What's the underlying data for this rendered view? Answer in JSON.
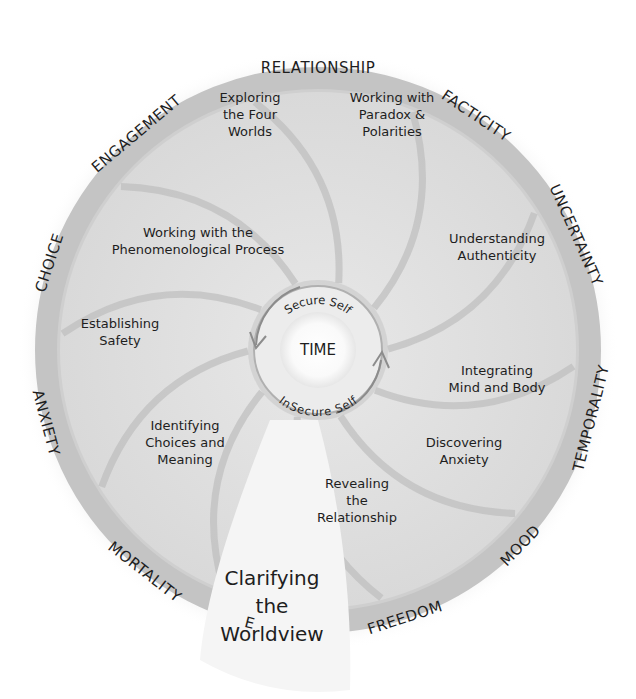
{
  "colors": {
    "background": "#ffffff",
    "ring": "#c9c9c9",
    "disk": "#dedede",
    "wedge_line": "#bdbdbd",
    "highlight_wedge": "#f4f4f4",
    "hub": "#fafafa",
    "hub_ring": "#a9a9a9",
    "text": "#1e1e1e"
  },
  "hub": {
    "center_label": "TIME",
    "top_label": "Secure Self",
    "bottom_label": "InSecure Self"
  },
  "outer_ring_labels": [
    "RELATIONSHIP",
    "FACTICITY",
    "UNCERTAINTY",
    "TEMPORALITY",
    "MOOD",
    "FREEDOM",
    "E",
    "MORTALITY",
    "ANXIETY",
    "CHOICE",
    "ENGAGEMENT"
  ],
  "segments": [
    {
      "id": "four-worlds",
      "lines": [
        "Exploring",
        "the Four",
        "Worlds"
      ]
    },
    {
      "id": "paradox",
      "lines": [
        "Working with",
        "Paradox &",
        "Polarities"
      ]
    },
    {
      "id": "authenticity",
      "lines": [
        "Understanding",
        "Authenticity"
      ]
    },
    {
      "id": "mind-body",
      "lines": [
        "Integrating",
        "Mind and Body"
      ]
    },
    {
      "id": "anxiety",
      "lines": [
        "Discovering",
        "Anxiety"
      ]
    },
    {
      "id": "relationship",
      "lines": [
        "Revealing",
        "the",
        "Relationship"
      ]
    },
    {
      "id": "worldview",
      "lines": [
        "Clarifying",
        "the",
        "Worldview"
      ]
    },
    {
      "id": "choices",
      "lines": [
        "Identifying",
        "Choices and",
        "Meaning"
      ]
    },
    {
      "id": "safety",
      "lines": [
        "Establishing",
        "Safety"
      ]
    },
    {
      "id": "phenomenological",
      "lines": [
        "Working with the",
        "Phenomenological Process"
      ]
    }
  ]
}
